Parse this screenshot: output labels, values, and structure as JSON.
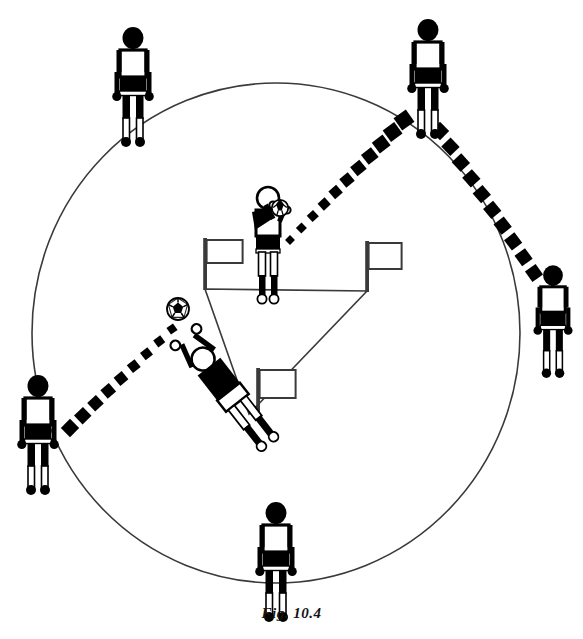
{
  "figure": {
    "caption": "Fig.  10.4",
    "colors": {
      "ink": "#000000",
      "line": "#3a3a3a",
      "paper": "#ffffff",
      "fill_white": "#ffffff"
    },
    "circle": {
      "label": "playing-circle",
      "cx": 276,
      "cy": 333,
      "rx": 244,
      "ry": 250,
      "stroke_width": 1.6
    },
    "triangle": {
      "label": "flag-triangle",
      "vertices": [
        {
          "name": "top-left-corner",
          "x": 205,
          "y": 289
        },
        {
          "name": "top-right-corner",
          "x": 367,
          "y": 291
        },
        {
          "name": "bottom-corner",
          "x": 249,
          "y": 414
        }
      ]
    },
    "flags": [
      {
        "name": "flag-top-left",
        "pole_x": 205,
        "pole_top": 238,
        "pole_bottom": 290,
        "flag_w": 36,
        "flag_h": 23,
        "flag_y": 240
      },
      {
        "name": "flag-top-right",
        "pole_x": 367,
        "pole_top": 241,
        "pole_bottom": 292,
        "flag_w": 33,
        "flag_h": 26,
        "flag_y": 243
      },
      {
        "name": "flag-bottom",
        "pole_x": 258,
        "pole_top": 368,
        "pole_bottom": 416,
        "flag_w": 36,
        "flag_h": 28,
        "flag_y": 370
      }
    ],
    "players": [
      {
        "name": "player-top-left",
        "role": "outside-receiver",
        "x": 133,
        "y": 30,
        "scale": 1.0,
        "head": "solid"
      },
      {
        "name": "player-top-right",
        "role": "outside-receiver",
        "x": 428,
        "y": 22,
        "scale": 1.0,
        "head": "solid"
      },
      {
        "name": "player-right",
        "role": "outside-receiver",
        "x": 553,
        "y": 268,
        "scale": 0.94,
        "head": "solid"
      },
      {
        "name": "player-bottom",
        "role": "outside-receiver",
        "x": 276,
        "y": 505,
        "scale": 1.0,
        "head": "solid"
      },
      {
        "name": "player-left",
        "role": "outside-server",
        "x": 38,
        "y": 378,
        "scale": 1.0,
        "head": "solid"
      },
      {
        "name": "player-center-thrower",
        "role": "inside-thrower",
        "x": 268,
        "y": 188,
        "scale": 0.98,
        "head": "outline"
      },
      {
        "name": "player-diving-keeper",
        "role": "diving-goalkeeper",
        "x": 196,
        "y": 350,
        "rotation": -38,
        "scale": 0.96,
        "head": "outline"
      }
    ],
    "ball": {
      "name": "soccer-ball",
      "x": 178,
      "y": 309,
      "r": 11
    },
    "trajectories": [
      {
        "name": "trajectory-thrower-to-top-right",
        "from": "player-center-thrower",
        "to": "player-top-right",
        "marker_count": 11,
        "start": {
          "x": 290,
          "y": 240
        },
        "end": {
          "x": 404,
          "y": 120
        },
        "size_start": 7,
        "size_end": 15
      },
      {
        "name": "trajectory-top-right-to-right",
        "from": "player-top-right",
        "to": "player-right",
        "marker_count": 10,
        "start": {
          "x": 440,
          "y": 131
        },
        "end": {
          "x": 534,
          "y": 273
        },
        "size_start": 13,
        "size_end": 13
      },
      {
        "name": "trajectory-left-to-keeper",
        "from": "player-left",
        "to": "soccer-ball",
        "marker_count": 9,
        "start": {
          "x": 70,
          "y": 428
        },
        "end": {
          "x": 172,
          "y": 329
        },
        "size_start": 13,
        "size_end": 8
      }
    ]
  }
}
